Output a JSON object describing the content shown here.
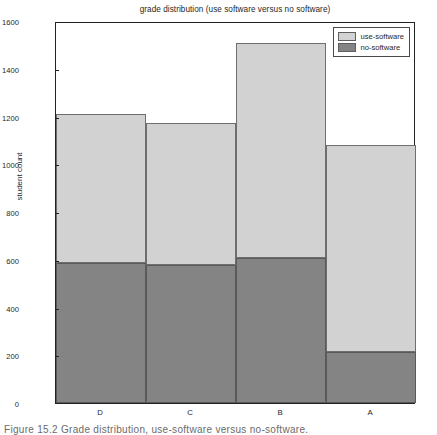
{
  "figure": {
    "caption": "Figure 15.2   Grade distribution, use-software versus no-software."
  },
  "chart_data": {
    "type": "bar",
    "subtype": "stacked",
    "title": "grade distribution (use software versus no software)",
    "xlabel": "",
    "ylabel": "student count",
    "categories": [
      "D",
      "C",
      "B",
      "A"
    ],
    "series": [
      {
        "name": "no-software",
        "color": "#848484",
        "values": [
          586,
          578,
          607,
          214
        ]
      },
      {
        "name": "use-software",
        "color": "#d2d2d2",
        "values": [
          624,
          594,
          900,
          866
        ]
      }
    ],
    "totals": [
      1210,
      1172,
      1507,
      1080
    ],
    "ylim": [
      0,
      1600
    ],
    "ytick_step": 200,
    "yticks": [
      0,
      200,
      400,
      600,
      800,
      1000,
      1200,
      1400,
      1600
    ],
    "ytick_labels": [
      "0",
      "200",
      "400",
      "600",
      "800",
      "1000",
      "1200",
      "1400",
      "1600"
    ],
    "grid": false,
    "legend_position": "top-right-inside",
    "legend_entries": [
      "use-software",
      "no-software"
    ]
  }
}
